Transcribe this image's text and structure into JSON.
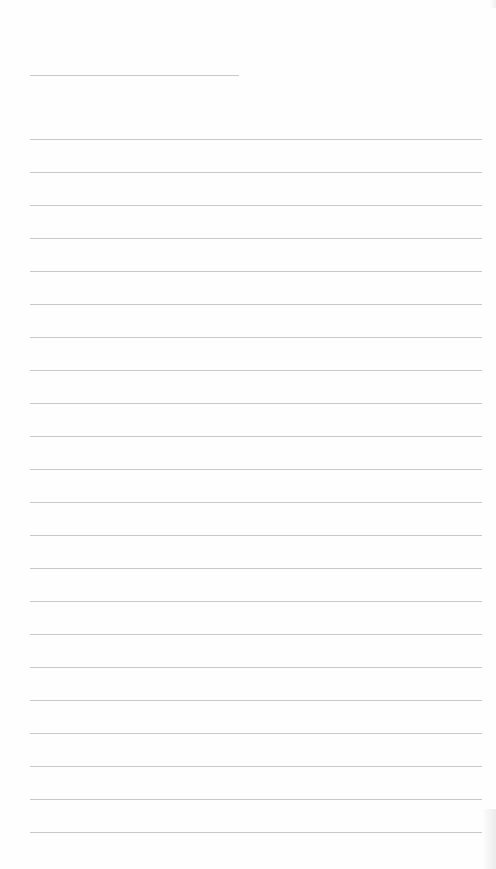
{
  "page": {
    "type": "lined-paper",
    "background": "#fefefe",
    "rule_color": "#c9c9c9",
    "header_rule": {
      "x": 30,
      "y": 75,
      "width": 209
    },
    "lines": {
      "x": 30,
      "width": 452,
      "first_y": 139,
      "spacing": 33,
      "count": 22
    }
  }
}
